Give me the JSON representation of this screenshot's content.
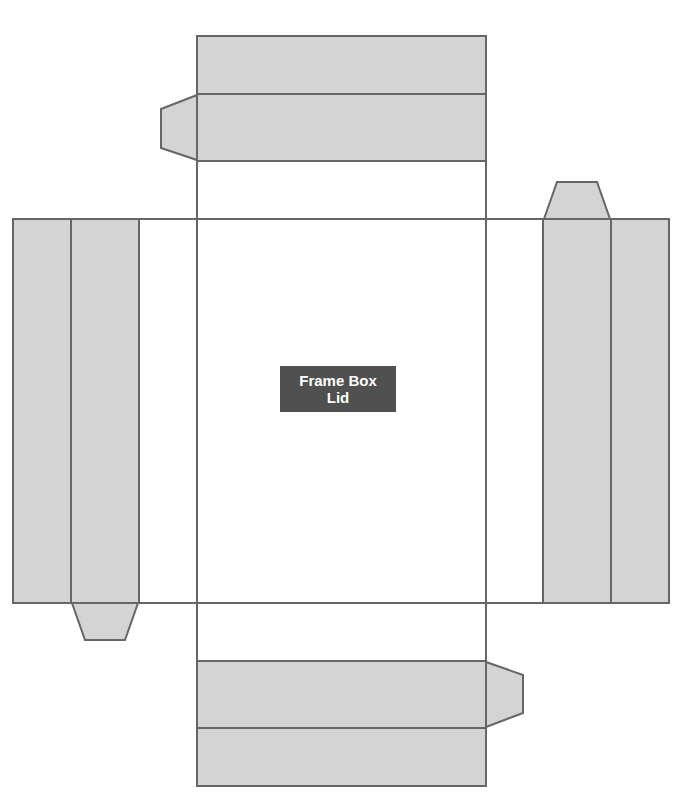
{
  "diagram": {
    "title_line1": "Frame Box",
    "title_line2": "Lid",
    "colors": {
      "panel_fill": "#d4d4d4",
      "stroke": "#666666",
      "label_bg": "#505050",
      "label_text": "#ffffff",
      "background": "#ffffff"
    },
    "parts": [
      {
        "name": "center-panel"
      },
      {
        "name": "top-flap-outer"
      },
      {
        "name": "top-flap-inner"
      },
      {
        "name": "top-flap-tab"
      },
      {
        "name": "bottom-flap-inner"
      },
      {
        "name": "bottom-flap-outer"
      },
      {
        "name": "bottom-flap-tab"
      },
      {
        "name": "left-flap-outer"
      },
      {
        "name": "left-flap-inner"
      },
      {
        "name": "left-flap-tab"
      },
      {
        "name": "right-flap-inner"
      },
      {
        "name": "right-flap-outer"
      },
      {
        "name": "right-flap-tab"
      }
    ]
  }
}
